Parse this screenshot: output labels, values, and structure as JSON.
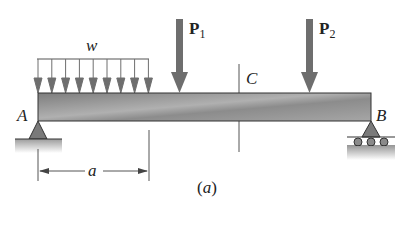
{
  "figure": {
    "caption": "(a)",
    "beam": {
      "label_left": "A",
      "label_right": "B",
      "section_label": "C"
    },
    "distributed_load": {
      "label": "w",
      "arrow_count": 9
    },
    "point_loads": [
      {
        "symbol": "P",
        "subscript": "1"
      },
      {
        "symbol": "P",
        "subscript": "2"
      }
    ],
    "dimension": {
      "label": "a"
    },
    "supports": {
      "left": "pin",
      "right": "roller"
    },
    "colors": {
      "beam": "#8a8a8a",
      "arrow": "#6e6e6e",
      "support": "#7a7a7a",
      "ground": "#b5b5b5",
      "line": "#333333"
    }
  }
}
